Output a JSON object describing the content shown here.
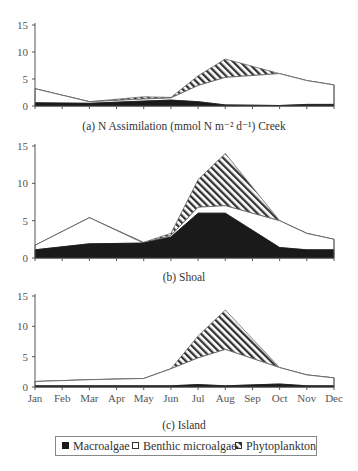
{
  "chart_data": [
    {
      "type": "area",
      "stacked": true,
      "title": "(a) N Assimilation (mmol N m⁻² d⁻¹) Creek",
      "xlabel": "",
      "ylabel": "",
      "ylim": [
        0,
        15
      ],
      "yticks": [
        0,
        5,
        10,
        15
      ],
      "categories": [
        "Jan",
        "Feb",
        "Mar",
        "Apr",
        "May",
        "Jun",
        "Jul",
        "Aug",
        "Sep",
        "Oct",
        "Nov",
        "Dec"
      ],
      "sample_months": [
        "Jan",
        "Mar",
        "May",
        "Jun",
        "Jul",
        "Aug",
        "Oct",
        "Nov",
        "Dec"
      ],
      "series": [
        {
          "name": "Macroalgae",
          "values": [
            0.6,
            0.5,
            0.9,
            1.1,
            0.8,
            0.2,
            0.1,
            0.3,
            0.3
          ]
        },
        {
          "name": "Benthic microalgae",
          "values": [
            2.6,
            0.3,
            0.4,
            0.4,
            3.0,
            5.1,
            5.9,
            4.4,
            3.6
          ]
        },
        {
          "name": "Phytoplankton",
          "values": [
            0.0,
            0.0,
            0.4,
            0.1,
            1.8,
            3.4,
            0.0,
            0.0,
            0.0
          ]
        }
      ],
      "totals": [
        3.2,
        0.8,
        1.7,
        1.6,
        5.6,
        8.7,
        6.0,
        4.7,
        3.9
      ],
      "grid": false
    },
    {
      "type": "area",
      "stacked": true,
      "title": "(b) Shoal",
      "ylim": [
        0,
        15
      ],
      "yticks": [
        0,
        5,
        10,
        15
      ],
      "categories": [
        "Jan",
        "Feb",
        "Mar",
        "Apr",
        "May",
        "Jun",
        "Jul",
        "Aug",
        "Sep",
        "Oct",
        "Nov",
        "Dec"
      ],
      "sample_months": [
        "Jan",
        "Mar",
        "May",
        "Jun",
        "Jul",
        "Aug",
        "Oct",
        "Nov",
        "Dec"
      ],
      "series": [
        {
          "name": "Macroalgae",
          "values": [
            1.1,
            1.9,
            2.0,
            2.8,
            6.0,
            6.0,
            1.4,
            1.1,
            1.1
          ]
        },
        {
          "name": "Benthic microalgae",
          "values": [
            0.6,
            3.5,
            0.0,
            0.2,
            0.8,
            1.0,
            3.6,
            2.2,
            1.4
          ]
        },
        {
          "name": "Phytoplankton",
          "values": [
            0.0,
            0.0,
            0.1,
            0.3,
            3.7,
            7.0,
            0.0,
            0.0,
            0.0
          ]
        }
      ],
      "totals": [
        1.7,
        5.4,
        2.1,
        3.3,
        10.5,
        14.0,
        5.0,
        3.3,
        2.5
      ],
      "grid": false
    },
    {
      "type": "area",
      "stacked": true,
      "title": "(c) Island",
      "ylim": [
        0,
        15
      ],
      "yticks": [
        0,
        5,
        10,
        15
      ],
      "categories": [
        "Jan",
        "Feb",
        "Mar",
        "Apr",
        "May",
        "Jun",
        "Jul",
        "Aug",
        "Sep",
        "Oct",
        "Nov",
        "Dec"
      ],
      "sample_months": [
        "Jan",
        "Mar",
        "May",
        "Jun",
        "Jul",
        "Aug",
        "Oct",
        "Nov",
        "Dec"
      ],
      "series": [
        {
          "name": "Macroalgae",
          "values": [
            0.2,
            0.2,
            0.2,
            0.2,
            0.4,
            0.2,
            0.5,
            0.2,
            0.2
          ]
        },
        {
          "name": "Benthic microalgae",
          "values": [
            0.7,
            1.0,
            1.2,
            2.8,
            4.4,
            6.0,
            2.7,
            1.8,
            1.3
          ]
        },
        {
          "name": "Phytoplankton",
          "values": [
            0.0,
            0.0,
            0.0,
            0.0,
            3.6,
            6.5,
            0.0,
            0.0,
            0.0
          ]
        }
      ],
      "totals": [
        0.9,
        1.2,
        1.4,
        3.0,
        8.4,
        12.7,
        3.2,
        2.0,
        1.5
      ],
      "grid": false
    }
  ],
  "x_axis": {
    "labels": [
      "Jan",
      "Feb",
      "Mar",
      "Apr",
      "May",
      "Jun",
      "Jul",
      "Aug",
      "Sep",
      "Oct",
      "Nov",
      "Dec"
    ],
    "shown_on_panel": 2
  },
  "legend": {
    "position": "bottom",
    "items": [
      {
        "label": "Macroalgae",
        "fill": "solid-black"
      },
      {
        "label": "Benthic microalgae",
        "fill": "white"
      },
      {
        "label": "Phytoplankton",
        "fill": "diagonal-hatch"
      }
    ]
  },
  "colors": {
    "macroalgae": "#1a1a1a",
    "benthic": "#ffffff",
    "hatch": "#333333",
    "axis": "#555555",
    "outline": "#666666"
  }
}
